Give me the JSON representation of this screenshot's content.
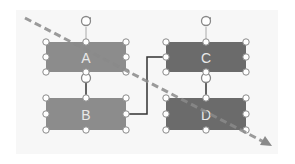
{
  "diagram": {
    "shapes": [
      {
        "id": "A",
        "label": "A",
        "fill": "#8c8c8c",
        "selected": true
      },
      {
        "id": "B",
        "label": "B",
        "fill": "#8c8c8c",
        "selected": true
      },
      {
        "id": "C",
        "label": "C",
        "fill": "#6b6b6b",
        "selected": true
      },
      {
        "id": "D",
        "label": "D",
        "fill": "#6b6b6b",
        "selected": true
      }
    ],
    "connectors": [
      {
        "from": "A",
        "to": "B",
        "style": "straight"
      },
      {
        "from": "C",
        "to": "D",
        "style": "straight"
      },
      {
        "from": "B",
        "to": "C",
        "style": "elbow"
      }
    ],
    "overlay_arrow": {
      "style": "dashed",
      "color": "#8a8a8a",
      "direction": "top-left to bottom-right"
    },
    "icons": [
      "rotate-handle-icon"
    ]
  }
}
